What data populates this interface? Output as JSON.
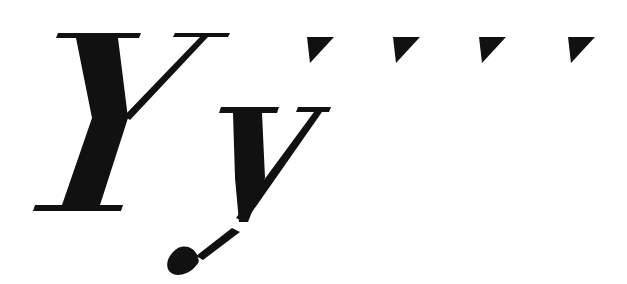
{
  "specimen": {
    "uppercase_glyph": "Y",
    "lowercase_glyph": "y",
    "style": "bold italic serif",
    "ink_color": "#111111",
    "background_color": "#ffffff",
    "marks": [
      {
        "shape": "triangle-down-right",
        "x": 307
      },
      {
        "shape": "triangle-down-right",
        "x": 393
      },
      {
        "shape": "triangle-down-right",
        "x": 479
      },
      {
        "shape": "triangle-down-right",
        "x": 568
      }
    ]
  }
}
